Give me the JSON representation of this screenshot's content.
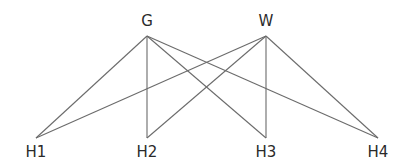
{
  "diagram": {
    "type": "bipartite-graph",
    "top_nodes": [
      {
        "id": "G",
        "label": "G",
        "x": 147,
        "y": 36,
        "label_y": 14
      },
      {
        "id": "W",
        "label": "W",
        "x": 266,
        "y": 36,
        "label_y": 14
      }
    ],
    "bottom_nodes": [
      {
        "id": "H1",
        "label": "H1",
        "x": 36,
        "y": 138,
        "label_y": 145
      },
      {
        "id": "H2",
        "label": "H2",
        "x": 147,
        "y": 138,
        "label_y": 145
      },
      {
        "id": "H3",
        "label": "H3",
        "x": 266,
        "y": 138,
        "label_y": 145
      },
      {
        "id": "H4",
        "label": "H4",
        "x": 378,
        "y": 138,
        "label_y": 145
      }
    ],
    "edges": [
      {
        "from": "G",
        "to": "H1"
      },
      {
        "from": "G",
        "to": "H2"
      },
      {
        "from": "G",
        "to": "H3"
      },
      {
        "from": "G",
        "to": "H4"
      },
      {
        "from": "W",
        "to": "H1"
      },
      {
        "from": "W",
        "to": "H2"
      },
      {
        "from": "W",
        "to": "H3"
      },
      {
        "from": "W",
        "to": "H4"
      }
    ],
    "colors": {
      "edge": "#6b6b6b",
      "label": "#2a2a2a",
      "background": "#ffffff"
    }
  }
}
